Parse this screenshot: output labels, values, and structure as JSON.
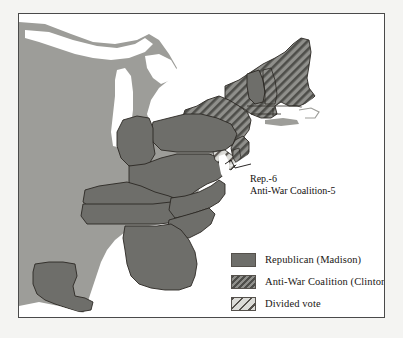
{
  "map": {
    "title": "United States presidential election 1812 results map",
    "colors": {
      "page_background": "#f4f4f2",
      "frame_border": "#4a4a4a",
      "ocean": "#ffffff",
      "unorganized_territory": "#9d9d99",
      "republican_fill": "#6e6e6a",
      "coalition_fill": "#8b8b87",
      "coalition_hatch": "#4e4e4a",
      "divided_fill": "#d8d8d4",
      "divided_hatch": "#55514c",
      "state_outline": "#2b2824"
    },
    "annotation": {
      "name": "maryland-delaware-split-callout",
      "line1": "Rep.-6",
      "line2": "Anti-War Coalition-5"
    },
    "legend": {
      "items": [
        {
          "id": "republican",
          "label": "Republican (Madison)",
          "pattern": "solid",
          "swatch_name": "legend-swatch-republican"
        },
        {
          "id": "anti-war-coalition",
          "label": "Anti-War Coalition (Clinton)",
          "pattern": "dark-diagonal-hatch",
          "swatch_name": "legend-swatch-anti-war-coalition"
        },
        {
          "id": "divided-vote",
          "label": "Divided vote",
          "pattern": "light-diagonal-hatch",
          "swatch_name": "legend-swatch-divided-vote"
        }
      ]
    },
    "regions": [
      {
        "id": "vermont",
        "label": "Vermont",
        "category": "republican"
      },
      {
        "id": "new-hampshire",
        "label": "New Hampshire",
        "category": "anti-war-coalition"
      },
      {
        "id": "massachusetts",
        "label": "Massachusetts",
        "category": "anti-war-coalition"
      },
      {
        "id": "rhode-island",
        "label": "Rhode Island",
        "category": "anti-war-coalition"
      },
      {
        "id": "connecticut",
        "label": "Connecticut",
        "category": "anti-war-coalition"
      },
      {
        "id": "new-york",
        "label": "New York",
        "category": "anti-war-coalition"
      },
      {
        "id": "new-jersey",
        "label": "New Jersey",
        "category": "anti-war-coalition"
      },
      {
        "id": "pennsylvania",
        "label": "Pennsylvania",
        "category": "republican"
      },
      {
        "id": "ohio",
        "label": "Ohio",
        "category": "republican"
      },
      {
        "id": "maryland",
        "label": "Maryland",
        "category": "divided-vote"
      },
      {
        "id": "delaware",
        "label": "Delaware",
        "category": "anti-war-coalition"
      },
      {
        "id": "virginia",
        "label": "Virginia",
        "category": "republican"
      },
      {
        "id": "kentucky",
        "label": "Kentucky",
        "category": "republican"
      },
      {
        "id": "tennessee",
        "label": "Tennessee",
        "category": "republican"
      },
      {
        "id": "north-carolina",
        "label": "North Carolina",
        "category": "republican"
      },
      {
        "id": "south-carolina",
        "label": "South Carolina",
        "category": "republican"
      },
      {
        "id": "georgia",
        "label": "Georgia",
        "category": "republican"
      },
      {
        "id": "louisiana",
        "label": "Louisiana",
        "category": "republican"
      }
    ]
  }
}
